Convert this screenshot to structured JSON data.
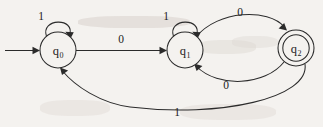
{
  "diagram": {
    "type": "finite-state-automaton",
    "background_color": "#f4f2ef",
    "ink_color": "#2b2b2b",
    "states": [
      {
        "id": "q0",
        "label": "q",
        "subscript": "0",
        "cx": 58,
        "cy": 50,
        "r": 18,
        "accepting": false,
        "start": true
      },
      {
        "id": "q1",
        "label": "q",
        "subscript": "1",
        "cx": 185,
        "cy": 50,
        "r": 18,
        "accepting": false,
        "start": false
      },
      {
        "id": "q2",
        "label": "q",
        "subscript": "2",
        "cx": 296,
        "cy": 48,
        "r": 18,
        "r_inner": 13,
        "accepting": true,
        "start": false
      }
    ],
    "transitions": [
      {
        "id": "t-start",
        "from": null,
        "to": "q0",
        "symbol": "",
        "kind": "start-arrow"
      },
      {
        "id": "t-q0-q0",
        "from": "q0",
        "to": "q0",
        "symbol": "1",
        "kind": "self-loop",
        "label_x": 41,
        "label_y": 16
      },
      {
        "id": "t-q0-q1",
        "from": "q0",
        "to": "q1",
        "symbol": "0",
        "kind": "straight",
        "label_x": 121,
        "label_y": 39
      },
      {
        "id": "t-q1-q1",
        "from": "q1",
        "to": "q1",
        "symbol": "1",
        "kind": "self-loop",
        "label_x": 166,
        "label_y": 16
      },
      {
        "id": "t-q1-q2",
        "from": "q1",
        "to": "q2",
        "symbol": "0",
        "kind": "arc-above",
        "label_x": 240,
        "label_y": 12
      },
      {
        "id": "t-q2-q1",
        "from": "q2",
        "to": "q1",
        "symbol": "0",
        "kind": "arc-below",
        "label_x": 226,
        "label_y": 85
      },
      {
        "id": "t-q2-q0",
        "from": "q2",
        "to": "q0",
        "symbol": "1",
        "kind": "arc-below-long",
        "label_x": 177,
        "label_y": 112
      }
    ]
  }
}
